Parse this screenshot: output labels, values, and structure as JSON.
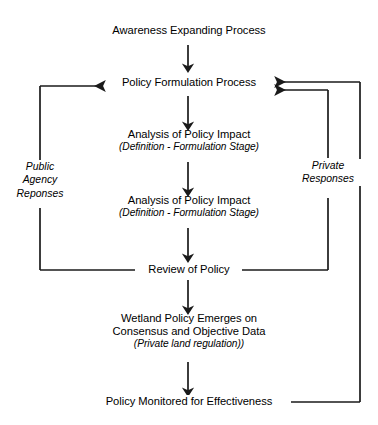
{
  "diagram": {
    "line_color": "#1a1a1a",
    "text_color": "#000000",
    "background": "#ffffff",
    "nodes": [
      {
        "id": "awareness",
        "label": "Awareness Expanding Process",
        "sub": ""
      },
      {
        "id": "policy-formulation",
        "label": "Policy Formulation Process",
        "sub": ""
      },
      {
        "id": "analysis-1",
        "label": "Analysis of Policy Impact",
        "sub": "(Definition - Formulation Stage)"
      },
      {
        "id": "analysis-2",
        "label": "Analysis of Policy Impact",
        "sub": "(Definition - Formulation Stage)"
      },
      {
        "id": "review",
        "label": "Review of Policy",
        "sub": ""
      },
      {
        "id": "wetland-policy",
        "label_line1": "Wetland Policy Emerges on",
        "label_line2": "Consensus and Objective Data",
        "sub": "(Private land regulation))"
      },
      {
        "id": "monitored",
        "label": "Policy Monitored for Effectiveness",
        "sub": ""
      }
    ],
    "edge_labels": [
      {
        "id": "public-agency-reponses",
        "line1": "Public",
        "line2": "Agency",
        "line3": "Reponses"
      },
      {
        "id": "private-responses",
        "line1": "Private",
        "line2": "Responses",
        "line3": ""
      }
    ]
  }
}
